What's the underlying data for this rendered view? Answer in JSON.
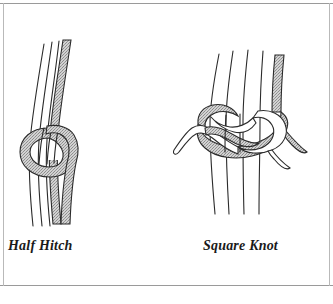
{
  "figure": {
    "background_color": "#ffffff",
    "frame": {
      "border_color": "#9a9a9a",
      "side_color": "#b9b9b9"
    },
    "ink_color": "#262626",
    "cord_fill_light": "#ffffff",
    "cord_fill_shaded": "#b4b4b4"
  },
  "diagrams": [
    {
      "id": "half-hitch",
      "caption": "Half Hitch",
      "cord_count_light": 3,
      "cord_count_shaded": 1,
      "description": "A shaded working cord wrapped once around a bundle of three light standing cords, forming a single loop."
    },
    {
      "id": "square-knot",
      "caption": "Square Knot",
      "cord_count_light": 4,
      "cord_count_shaded": 1,
      "description": "Two interlocking loops — one shaded, one light — tied around a bundle of four vertical standing cords."
    }
  ],
  "labels": {
    "half_hitch": "Half Hitch",
    "square_knot": "Square Knot"
  }
}
